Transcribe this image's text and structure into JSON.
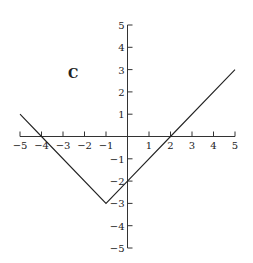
{
  "chart_data": {
    "type": "line",
    "title": "",
    "panel_label": "C",
    "xlabel": "",
    "ylabel": "",
    "xlim": [
      -5,
      5
    ],
    "ylim": [
      -5,
      5
    ],
    "grid": false,
    "x_ticks": [
      -5,
      -4,
      -3,
      -2,
      -1,
      1,
      2,
      3,
      4,
      5
    ],
    "y_ticks": [
      -5,
      -4,
      -3,
      -2,
      -1,
      1,
      2,
      3,
      4,
      5
    ],
    "series": [
      {
        "name": "f(x) = |x + 1| - 3",
        "x": [
          -5,
          -4,
          -1,
          0,
          2,
          5
        ],
        "y": [
          1,
          0,
          -3,
          -2,
          0,
          3
        ]
      }
    ]
  },
  "colors": {
    "axis": "#333333",
    "line": "#222222",
    "background": "#ffffff"
  }
}
